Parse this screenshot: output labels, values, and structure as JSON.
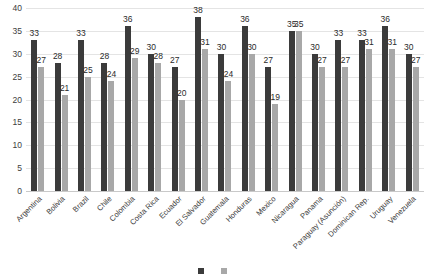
{
  "chart_data": {
    "type": "bar",
    "title": "",
    "xlabel": "",
    "ylabel": "",
    "ylim": [
      0,
      40
    ],
    "yticks": [
      0,
      5,
      10,
      15,
      20,
      25,
      30,
      35,
      40
    ],
    "grid": true,
    "legend_position": "bottom",
    "data_labels": true,
    "categories": [
      "Argentina",
      "Bolivia",
      "Brazil",
      "Chile",
      "Colombia",
      "Costa Rica",
      "Ecuador",
      "El Salvador",
      "Guatemala",
      "Honduras",
      "Mexico",
      "Nicaragua",
      "Panama",
      "Paraguay (Asunción)",
      "Dominican Rep.",
      "Uruguay",
      "Venezuela"
    ],
    "series": [
      {
        "name": "Series 1",
        "color": "#3b3b3b",
        "values": [
          33,
          28,
          33,
          28,
          36,
          30,
          27,
          38,
          30,
          36,
          27,
          35,
          30,
          33,
          33,
          36,
          30
        ]
      },
      {
        "name": "Series 2",
        "color": "#a8a8a8",
        "values": [
          27,
          21,
          25,
          24,
          29,
          28,
          20,
          31,
          24,
          30,
          19,
          35,
          27,
          27,
          31,
          31,
          27
        ]
      }
    ]
  },
  "legend": {
    "items": [
      {
        "label": "",
        "color": "#3b3b3b"
      },
      {
        "label": "",
        "color": "#a8a8a8"
      }
    ]
  }
}
